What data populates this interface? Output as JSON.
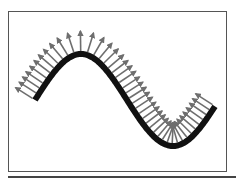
{
  "figure": {
    "colors": {
      "curve": "#111111",
      "arrow": "#6e6e6e",
      "frame": "#555555",
      "rule": "#444444"
    },
    "curve": {
      "x_start": 35,
      "x_end": 215,
      "baseline_y": 100,
      "amplitude": 46,
      "period": 184,
      "stroke_width": 6
    },
    "normals": {
      "count": 44,
      "length": 20,
      "stroke_width": 1.6,
      "side": "upper-left"
    }
  }
}
